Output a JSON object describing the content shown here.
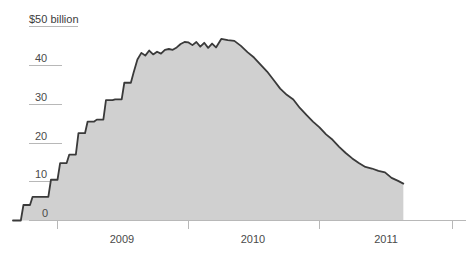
{
  "chart_data": {
    "type": "area",
    "title": "",
    "subtitle": "",
    "xlabel": "",
    "ylabel": "$50 billion",
    "unit": "billion USD",
    "grid": true,
    "legend": "none",
    "ylim": [
      0,
      50
    ],
    "yticks": [
      0,
      10,
      20,
      30,
      40,
      50
    ],
    "ytick_labels": [
      "0",
      "10",
      "20",
      "30",
      "40",
      "$50 billion"
    ],
    "xlim": [
      "2008.6",
      "2011.7"
    ],
    "xticks": [
      "2009",
      "2010",
      "2011"
    ],
    "xtick_labels": [
      "2009",
      "2010",
      "2011"
    ],
    "series": [
      {
        "name": "Balance",
        "x": [
          2008.66,
          2008.72,
          2008.74,
          2008.79,
          2008.81,
          2008.86,
          2008.88,
          2008.93,
          2008.95,
          2009.0,
          2009.02,
          2009.07,
          2009.09,
          2009.14,
          2009.16,
          2009.21,
          2009.23,
          2009.28,
          2009.3,
          2009.35,
          2009.37,
          2009.42,
          2009.44,
          2009.49,
          2009.51,
          2009.56,
          2009.58,
          2009.61,
          2009.64,
          2009.67,
          2009.7,
          2009.73,
          2009.76,
          2009.79,
          2009.82,
          2009.85,
          2009.88,
          2009.91,
          2009.94,
          2009.97,
          2010.0,
          2010.03,
          2010.06,
          2010.09,
          2010.12,
          2010.15,
          2010.18,
          2010.21,
          2010.25,
          2010.3,
          2010.35,
          2010.4,
          2010.45,
          2010.5,
          2010.55,
          2010.6,
          2010.65,
          2010.7,
          2010.75,
          2010.8,
          2010.85,
          2010.9,
          2010.95,
          2011.0,
          2011.05,
          2011.1,
          2011.15,
          2011.2,
          2011.25,
          2011.3,
          2011.35,
          2011.4,
          2011.45,
          2011.5,
          2011.55,
          2011.6,
          2011.64
        ],
        "values": [
          0.0,
          0.0,
          4.0,
          4.0,
          6.1,
          6.1,
          6.1,
          6.1,
          10.5,
          10.5,
          14.8,
          14.8,
          17.0,
          17.0,
          22.5,
          22.5,
          25.5,
          25.5,
          26.0,
          26.0,
          31.0,
          31.0,
          31.2,
          31.2,
          35.5,
          35.5,
          38.0,
          41.5,
          43.2,
          42.5,
          43.8,
          42.8,
          43.5,
          43.0,
          44.0,
          44.2,
          44.0,
          44.6,
          45.5,
          46.0,
          45.9,
          45.2,
          46.0,
          44.8,
          45.8,
          44.5,
          45.6,
          44.6,
          46.8,
          46.5,
          46.3,
          45.0,
          43.4,
          42.0,
          40.2,
          38.4,
          36.2,
          34.0,
          32.4,
          31.2,
          29.0,
          27.2,
          25.5,
          24.0,
          22.2,
          20.8,
          19.0,
          17.4,
          16.0,
          14.8,
          13.8,
          13.4,
          12.8,
          12.4,
          11.0,
          10.2,
          9.5
        ]
      }
    ]
  },
  "axis": {
    "y_tick_0": "0",
    "y_tick_10": "10",
    "y_tick_20": "20",
    "y_tick_30": "30",
    "y_tick_40": "40",
    "y_tick_50": "$50 billion",
    "x_tick_2009": "2009",
    "x_tick_2010": "2010",
    "x_tick_2011": "2011"
  },
  "colors": {
    "area_fill": "#d0d0d0",
    "line": "#3a3a3a",
    "axis": "#b5b5b5",
    "text": "#4a4a4a",
    "background": "#ffffff"
  }
}
